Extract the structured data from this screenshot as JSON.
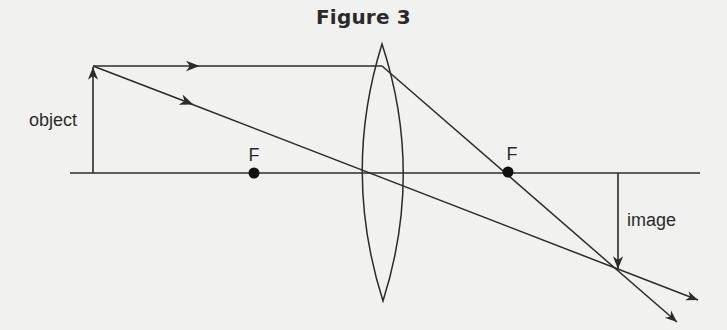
{
  "title": "Figure 3",
  "labels": {
    "object": "object",
    "image": "image",
    "focal_left": "F",
    "focal_right": "F"
  },
  "colors": {
    "background": "#f1f1f0",
    "ink": "#2b2b2b"
  },
  "diagram": {
    "type": "convex lens ray diagram",
    "principal_axis": {
      "x1": 70,
      "y": 173,
      "x2": 700
    },
    "lens": {
      "center_x": 382,
      "top_y": 44,
      "bottom_y": 301,
      "half_width": 20
    },
    "focal_points": [
      {
        "x": 254,
        "y": 173
      },
      {
        "x": 508,
        "y": 173
      }
    ],
    "object_arrow": {
      "x": 93,
      "base_y": 173,
      "tip_y": 66
    },
    "image_arrow": {
      "x": 618,
      "base_y": 173,
      "tip_y": 270
    },
    "rays": [
      {
        "name": "parallel-ray",
        "points": [
          [
            93,
            66
          ],
          [
            382,
            66
          ],
          [
            508,
            173
          ],
          [
            677,
            322
          ]
        ]
      },
      {
        "name": "center-ray",
        "points": [
          [
            93,
            66
          ],
          [
            698,
            300
          ]
        ]
      }
    ]
  }
}
